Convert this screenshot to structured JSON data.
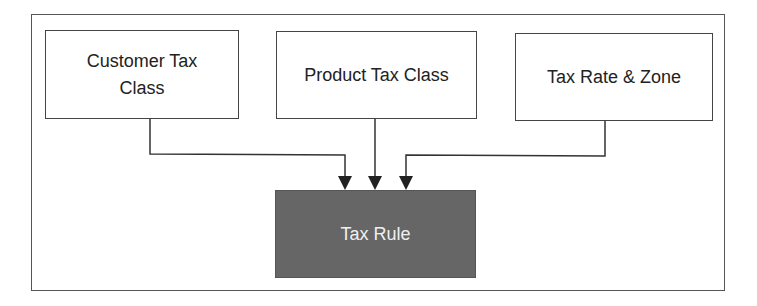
{
  "diagram": {
    "type": "flow",
    "nodes": [
      {
        "id": "customer_tax_class",
        "label_line1": "Customer Tax",
        "label_line2": "Class"
      },
      {
        "id": "product_tax_class",
        "label": "Product Tax Class"
      },
      {
        "id": "tax_rate_zone",
        "label": "Tax Rate & Zone"
      },
      {
        "id": "tax_rule",
        "label": "Tax Rule",
        "fill": "#666666",
        "text_color": "#f0f0f0"
      }
    ],
    "edges": [
      {
        "from": "customer_tax_class",
        "to": "tax_rule"
      },
      {
        "from": "product_tax_class",
        "to": "tax_rule"
      },
      {
        "from": "tax_rate_zone",
        "to": "tax_rule"
      }
    ],
    "colors": {
      "line": "#333333",
      "border": "#444444",
      "rule_fill": "#666666"
    }
  }
}
